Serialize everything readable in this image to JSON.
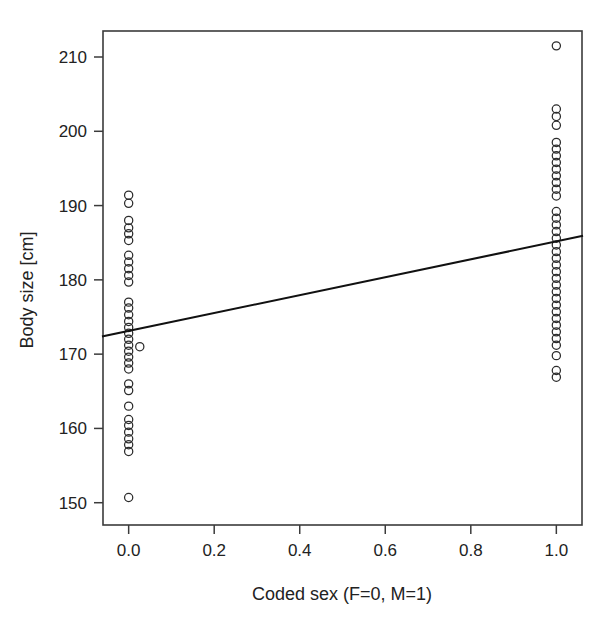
{
  "chart_data": {
    "type": "scatter",
    "title": "",
    "subtitle": "",
    "xlabel": "Coded sex (F=0, M=1)",
    "ylabel": "Body size [cm]",
    "xlim": [
      -0.06,
      1.06
    ],
    "ylim": [
      147.0,
      213.5
    ],
    "xticks": [
      "0.0",
      "0.2",
      "0.4",
      "0.6",
      "0.8",
      "1.0"
    ],
    "xtick_values": [
      0.0,
      0.2,
      0.4,
      0.6,
      0.8,
      1.0
    ],
    "yticks": [
      "150",
      "160",
      "170",
      "180",
      "190",
      "200",
      "210"
    ],
    "ytick_values": [
      150,
      160,
      170,
      180,
      190,
      200,
      210
    ],
    "grid": false,
    "legend": null,
    "marker": "open-circle",
    "marker_color": "#2b2b2b",
    "line_color": "#111111",
    "frame_color": "#3b3b3b",
    "series": [
      {
        "name": "Females (coded sex = 0)",
        "x_value": 0.0,
        "values": [
          191.4,
          190.3,
          188.0,
          187.0,
          186.2,
          185.3,
          183.3,
          182.4,
          181.5,
          180.6,
          179.7,
          177.0,
          176.2,
          175.3,
          174.4,
          173.6,
          172.8,
          172.0,
          171.2,
          170.4,
          169.6,
          168.8,
          168.0,
          166.0,
          165.1,
          163.0,
          161.2,
          160.4,
          159.5,
          158.6,
          157.8,
          156.9,
          150.7
        ]
      },
      {
        "name": "Females offset point",
        "x_value": 0.026,
        "values": [
          171.0
        ]
      },
      {
        "name": "Males (coded sex = 1)",
        "x_value": 1.0,
        "values": [
          211.5,
          203.0,
          202.0,
          200.8,
          198.5,
          197.6,
          196.7,
          195.8,
          194.9,
          194.0,
          193.1,
          192.2,
          191.3,
          189.2,
          188.3,
          187.4,
          186.5,
          185.6,
          184.7,
          183.8,
          182.9,
          182.0,
          181.1,
          180.2,
          179.3,
          178.4,
          177.5,
          176.6,
          175.7,
          174.8,
          173.9,
          173.0,
          172.1,
          171.2,
          169.8,
          167.8,
          166.9
        ]
      }
    ],
    "regression_line": {
      "name": "Fitted regression line",
      "x_start": -0.06,
      "y_start": 172.4,
      "x_end": 1.06,
      "y_end": 185.9,
      "intercept": 173.1,
      "slope": 12.1
    }
  }
}
